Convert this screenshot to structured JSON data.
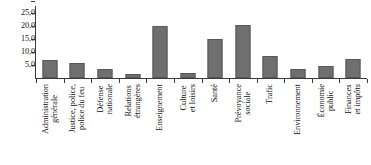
{
  "chart_data": {
    "type": "bar",
    "title": "",
    "subtitle": "",
    "xlabel": "",
    "ylabel": "",
    "ylim": [
      0,
      27.5
    ],
    "grid": false,
    "legend": null,
    "bar_color": "#6f6f6f",
    "axis_color": "#3a3a3a",
    "y_ticks": [
      "25,0",
      "20,0",
      "15,0",
      "10,0",
      "5,0"
    ],
    "y_tick_values": [
      25.0,
      20.0,
      15.0,
      10.0,
      5.0
    ],
    "categories": [
      "Administration générale",
      "Justice, police, police du feu",
      "Défense nationale",
      "Relations étrangères",
      "Enseignement",
      "Culture et loisirs",
      "Santé",
      "Prévoyance sociale",
      "Trafic",
      "Environnement",
      "Économie publique",
      "Finances et impôts"
    ],
    "category_lines": [
      [
        "Administration",
        "générale"
      ],
      [
        "Justice, police,",
        "police du feu"
      ],
      [
        "Défense",
        "nationale"
      ],
      [
        "Relations",
        "étrangères"
      ],
      [
        "Enseignement",
        ""
      ],
      [
        "Culture",
        "et loisirs"
      ],
      [
        "Santé",
        ""
      ],
      [
        "Prévoyance",
        "sociale"
      ],
      [
        "Trafic",
        ""
      ],
      [
        "Environnement",
        ""
      ],
      [
        "Économie",
        "public"
      ],
      [
        "Finances",
        "et impôts"
      ]
    ],
    "values": [
      7.0,
      6.0,
      3.5,
      1.5,
      20.0,
      1.8,
      15.0,
      20.5,
      8.5,
      3.5,
      4.5,
      7.5
    ]
  }
}
